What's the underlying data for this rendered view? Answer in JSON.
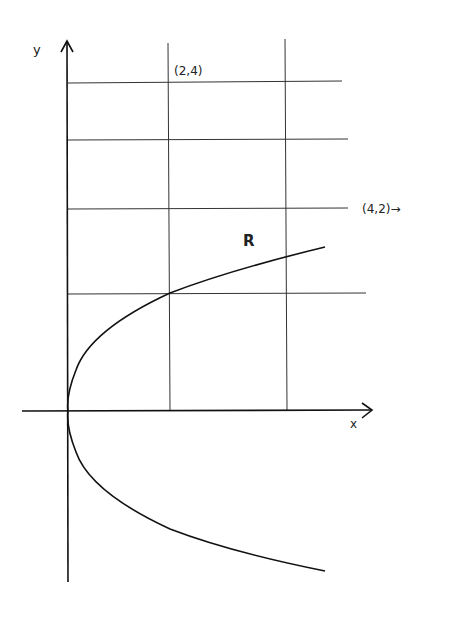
{
  "diagram": {
    "type": "parabola-region-figure",
    "axes": {
      "x_label": "x",
      "y_label": "y"
    },
    "region_label": "R",
    "point_labels": [
      {
        "text": "(2,4)"
      },
      {
        "text": "(4,2)→"
      }
    ],
    "curve": "x = y^2 / 2 (parabola opening right, vertex at origin)",
    "colors": {
      "stroke": "#1a1a1a",
      "background": "#ffffff"
    }
  }
}
